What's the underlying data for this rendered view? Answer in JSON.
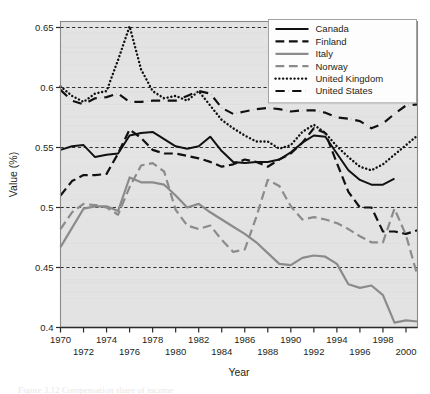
{
  "chart_data": {
    "type": "line",
    "title": "",
    "xlabel": "Year",
    "ylabel": "Value (%)",
    "xlim": [
      1970,
      2001
    ],
    "ylim": [
      0.4,
      0.655
    ],
    "yticks": [
      0.4,
      0.45,
      0.5,
      0.55,
      0.6,
      0.65
    ],
    "ytick_labels": [
      "0.4",
      "0.45",
      "0.5",
      "0.55",
      "0.6",
      "0.65"
    ],
    "xticks": [
      1970,
      1971,
      1972,
      1973,
      1974,
      1975,
      1976,
      1977,
      1978,
      1979,
      1980,
      1981,
      1982,
      1983,
      1984,
      1985,
      1986,
      1987,
      1988,
      1989,
      1990,
      1991,
      1992,
      1993,
      1994,
      1995,
      1996,
      1997,
      1998,
      1999,
      2000,
      2001
    ],
    "xtick_labels_top": [
      "1970",
      "1974",
      "1978",
      "1982",
      "1986",
      "1990",
      "1994",
      "1998"
    ],
    "xtick_labels_top_values": [
      1970,
      1974,
      1978,
      1982,
      1986,
      1990,
      1994,
      1998
    ],
    "xtick_labels_bottom": [
      "1972",
      "1976",
      "1980",
      "1984",
      "1988",
      "1992",
      "1996",
      "2000"
    ],
    "xtick_labels_bottom_values": [
      1972,
      1976,
      1980,
      1984,
      1988,
      1992,
      1996,
      2000
    ],
    "grid": "horizontal-dashed",
    "legend_position": "top-right",
    "plot_background": "#e3e3e3",
    "x": [
      1970,
      1971,
      1972,
      1973,
      1974,
      1975,
      1976,
      1977,
      1978,
      1979,
      1980,
      1981,
      1982,
      1983,
      1984,
      1985,
      1986,
      1987,
      1988,
      1989,
      1990,
      1991,
      1992,
      1993,
      1994,
      1995,
      1996,
      1997,
      1998,
      1999,
      2000,
      2001
    ],
    "series": [
      {
        "name": "Canada",
        "color": "#111111",
        "style": "solid",
        "width": 2.0,
        "values": [
          0.548,
          0.551,
          0.552,
          0.542,
          0.544,
          0.545,
          0.56,
          0.562,
          0.563,
          0.557,
          0.551,
          0.549,
          0.551,
          0.559,
          0.547,
          0.538,
          0.537,
          0.538,
          0.538,
          0.54,
          0.546,
          0.554,
          0.56,
          0.559,
          0.545,
          0.531,
          0.523,
          0.519,
          0.519,
          0.524,
          null,
          null
        ]
      },
      {
        "name": "Finland",
        "color": "#111111",
        "style": "dashed",
        "width": 2.2,
        "values": [
          0.51,
          0.522,
          0.527,
          0.527,
          0.528,
          0.545,
          0.565,
          0.558,
          0.548,
          0.545,
          0.545,
          0.543,
          0.541,
          0.538,
          0.534,
          0.536,
          0.54,
          0.538,
          0.534,
          0.54,
          0.545,
          0.554,
          0.566,
          0.562,
          0.537,
          0.513,
          0.5,
          0.5,
          0.48,
          0.48,
          0.478,
          0.481
        ]
      },
      {
        "name": "Italy",
        "color": "#8b8b8b",
        "style": "solid",
        "width": 2.2,
        "values": [
          0.467,
          0.483,
          0.499,
          0.501,
          0.501,
          0.497,
          0.525,
          0.521,
          0.521,
          0.519,
          0.51,
          0.5,
          0.503,
          0.496,
          0.49,
          0.484,
          0.478,
          0.471,
          0.462,
          0.453,
          0.452,
          0.458,
          0.46,
          0.459,
          0.453,
          0.436,
          0.433,
          0.435,
          0.427,
          0.404,
          0.406,
          0.405
        ]
      },
      {
        "name": "Norway",
        "color": "#8b8b8b",
        "style": "dashed",
        "width": 2.2,
        "values": [
          0.482,
          0.496,
          0.503,
          0.502,
          0.5,
          0.494,
          0.517,
          0.535,
          0.537,
          0.53,
          0.498,
          0.485,
          0.482,
          0.485,
          0.473,
          0.463,
          0.465,
          0.492,
          0.523,
          0.518,
          0.501,
          0.49,
          0.492,
          0.49,
          0.487,
          0.482,
          0.476,
          0.471,
          0.471,
          0.499,
          0.477,
          0.443
        ]
      },
      {
        "name": "United Kingdom",
        "color": "#111111",
        "style": "dotted",
        "width": 2.4,
        "values": [
          0.601,
          0.593,
          0.588,
          0.595,
          0.597,
          0.623,
          0.651,
          0.615,
          0.597,
          0.591,
          0.593,
          0.589,
          0.597,
          0.585,
          0.573,
          0.566,
          0.56,
          0.555,
          0.555,
          0.549,
          0.552,
          0.563,
          0.569,
          0.562,
          0.551,
          0.542,
          0.534,
          0.531,
          0.536,
          0.544,
          0.552,
          0.56
        ]
      },
      {
        "name": "United States",
        "color": "#111111",
        "style": "dashdot",
        "width": 2.2,
        "values": [
          0.598,
          0.589,
          0.586,
          0.591,
          0.592,
          0.595,
          0.588,
          0.588,
          0.589,
          0.589,
          0.589,
          0.593,
          0.597,
          0.595,
          0.583,
          0.578,
          0.58,
          0.582,
          0.583,
          0.582,
          0.58,
          0.581,
          0.581,
          0.579,
          0.575,
          0.574,
          0.572,
          0.566,
          0.57,
          0.578,
          0.585,
          0.586
        ]
      }
    ]
  },
  "legend": {
    "entries": [
      {
        "label": "Canada"
      },
      {
        "label": "Finland"
      },
      {
        "label": "Italy"
      },
      {
        "label": "Norway"
      },
      {
        "label": "United Kingdom"
      },
      {
        "label": "United States"
      }
    ]
  },
  "caption": {
    "sliver_text": "Figure 3.12  Compensation share of income"
  }
}
